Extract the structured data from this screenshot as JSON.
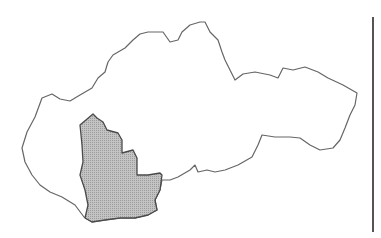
{
  "map": {
    "subject": "Slovakia outline map",
    "highlighted_region": "southwest region (shaded)",
    "colors": {
      "background": "#ffffff",
      "country_fill": "#ffffff",
      "border_stroke": "#666666",
      "highlight_fill": "#b8b8b8",
      "highlight_stroke": "#4a4a4a",
      "divider": "#555555"
    },
    "country_outline": "M22,148 L27,132 L35,117 L42,98 L52,94 L60,99 L70,101 L80,95 L92,88 L98,78 L105,72 L108,62 L113,55 L125,48 L133,40 L140,34 L148,32 L163,32 L170,42 L178,40 L182,32 L190,25 L200,22 L205,22 L210,32 L218,40 L222,52 L225,60 L230,70 L235,80 L243,74 L255,72 L270,75 L278,78 L283,68 L293,70 L305,67 L318,72 L328,78 L343,85 L357,93 L355,105 L350,115 L345,128 L340,140 L333,148 L320,150 L310,145 L300,138 L290,137 L275,137 L262,135 L258,145 L252,157 L238,165 L225,170 L215,172 L207,170 L198,172 L195,165 L190,170 L178,177 L170,180 L162,180 L160,190 L155,200 L157,210 L148,215 L135,218 L120,218 L105,220 L92,222 L84,217 L75,205 L62,197 L50,192 L40,185 L32,175 L25,162 Z",
    "highlight_outline": "M93,114 L97,118 L103,122 L107,130 L118,133 L122,140 L122,153 L133,150 L137,158 L137,175 L148,175 L160,173 L162,175 L160,190 L155,200 L157,210 L148,215 L135,218 L120,218 L105,220 L92,222 L85,218 L88,205 L85,190 L80,175 L83,162 L82,145 L80,125 Z"
  }
}
